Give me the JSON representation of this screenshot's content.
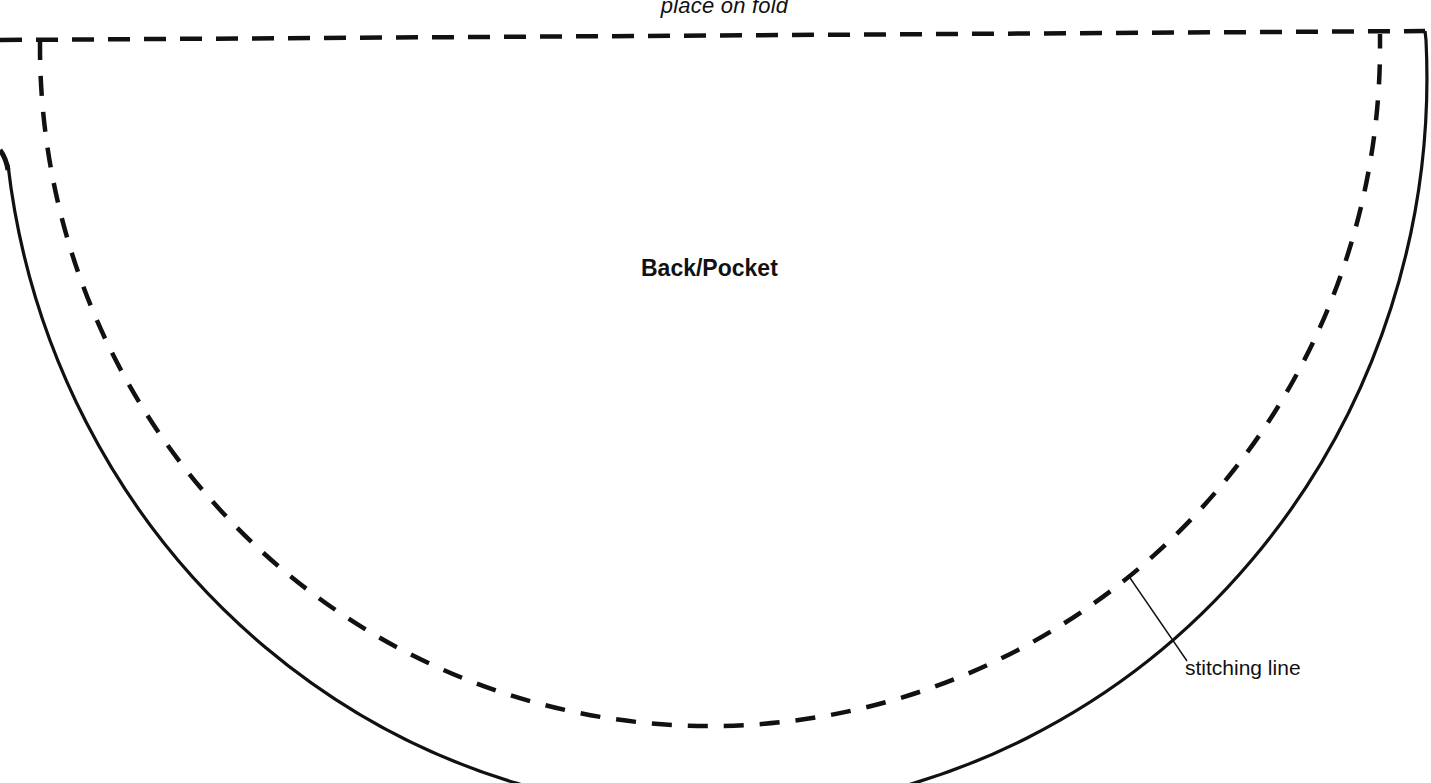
{
  "pattern": {
    "fold_label": "place on fold",
    "piece_title": "Back/Pocket",
    "stitching_label": "stitching line",
    "colors": {
      "background": "#ffffff",
      "line": "#111111"
    },
    "lines": {
      "fold_line": "dashed",
      "cut_line": "solid",
      "stitching_line": "dashed"
    }
  }
}
